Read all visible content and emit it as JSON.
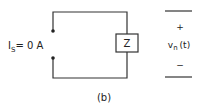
{
  "figure": {
    "caption": "(b)",
    "colors": {
      "stroke": "#333333",
      "background": "#ffffff"
    },
    "source_label": {
      "symbol": "I",
      "subscript": "S",
      "value": "= 0 A"
    },
    "impedance_label": "Z",
    "output": {
      "plus": "+",
      "symbol": "v",
      "subscript": "n",
      "argument": "(t)",
      "minus": "−"
    }
  }
}
